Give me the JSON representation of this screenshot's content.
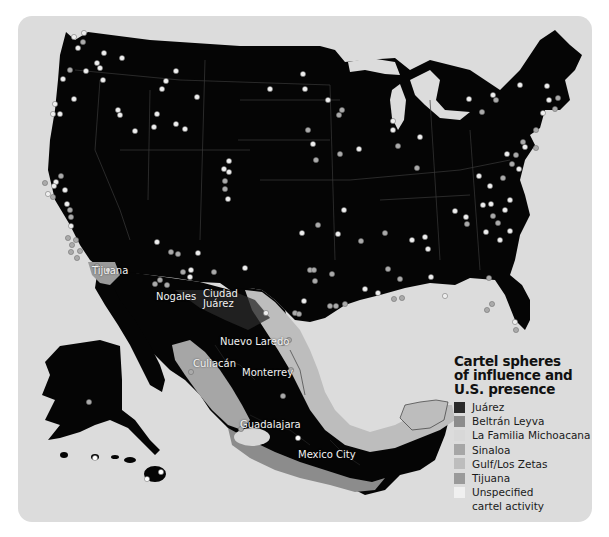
{
  "map": {
    "title": "Cartel spheres of influence and U.S. presence",
    "background_color": "#dcdcdc",
    "land_color": "#050505",
    "cities": [
      {
        "name": "Tijuana",
        "x": 92,
        "y": 265
      },
      {
        "name": "Nogales",
        "x": 156,
        "y": 291
      },
      {
        "name": "Ciudad",
        "x": 203,
        "y": 288
      },
      {
        "name": "Juárez",
        "x": 203,
        "y": 298
      },
      {
        "name": "Nuevo Laredo",
        "x": 220,
        "y": 336
      },
      {
        "name": "Culiacán",
        "x": 193,
        "y": 358
      },
      {
        "name": "Monterrey",
        "x": 242,
        "y": 367
      },
      {
        "name": "Guadalajara",
        "x": 240,
        "y": 419
      },
      {
        "name": "Mexico City",
        "x": 298,
        "y": 449
      }
    ]
  },
  "legend": {
    "title_lines": [
      "Cartel spheres",
      "of influence and",
      "U.S. presence"
    ],
    "items": [
      {
        "label": "Juárez",
        "color": "#2a2a2a"
      },
      {
        "label": "Beltrán Leyva",
        "color": "#8c8c8c"
      },
      {
        "label": "La Familia Michoacana",
        "color": "#d8d8d8"
      },
      {
        "label": "Sinaloa",
        "color": "#a6a6a6"
      },
      {
        "label": "Gulf/Los Zetas",
        "color": "#bdbdbd"
      },
      {
        "label": "Tijuana",
        "color": "#9a9a9a"
      },
      {
        "label": "Unspecified",
        "color": "#f0f0f0"
      },
      {
        "label": "cartel activity",
        "color": null
      }
    ]
  }
}
